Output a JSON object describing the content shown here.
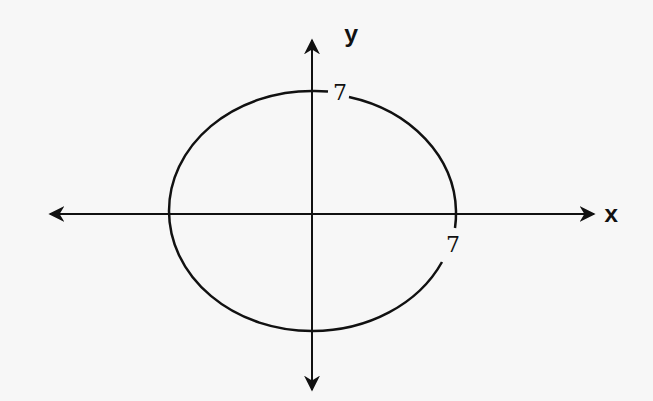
{
  "diagram": {
    "title": "",
    "axes": {
      "x_label": "x",
      "y_label": "y"
    },
    "ellipse": {
      "center": [
        0,
        0
      ],
      "labels": {
        "y_intercept": "7",
        "x_intercept": "7"
      }
    },
    "colors": {
      "stroke": "#111111",
      "background": "#f7f7f7"
    }
  }
}
